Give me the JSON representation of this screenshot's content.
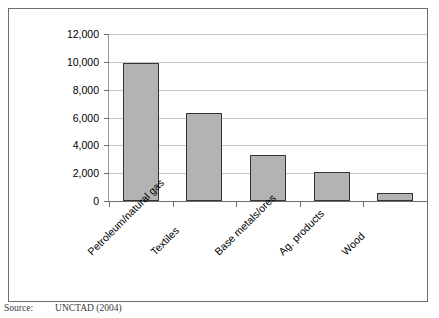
{
  "figure": {
    "source_label": "Source:",
    "source_text": "UNCTAD (2004)"
  },
  "chart_data": {
    "type": "bar",
    "title": "",
    "xlabel": "",
    "ylabel": "Million dollars",
    "categories": [
      "Petroleum/natural gas",
      "Textiles",
      "Base metals/ores",
      "Ag. products",
      "Wood"
    ],
    "values": [
      9900,
      6350,
      3300,
      2050,
      600
    ],
    "ylim": [
      0,
      12000
    ],
    "ytick_values": [
      0,
      2000,
      4000,
      6000,
      8000,
      10000,
      12000
    ],
    "ytick_labels": [
      "0",
      "2,000",
      "4,000",
      "6,000",
      "8,000",
      "10,000",
      "12,000"
    ],
    "grid": true,
    "legend": false,
    "bar_color": "#b3b3b3",
    "bar_border_color": "#333333",
    "gridline_color": "#c8c8c8",
    "axis_color": "#6e6e6e"
  }
}
